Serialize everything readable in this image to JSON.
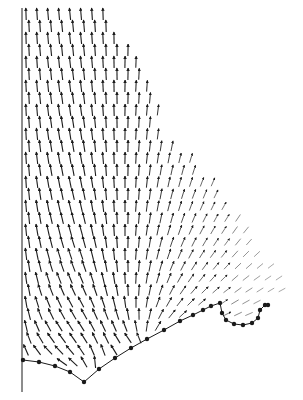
{
  "figure": {
    "type": "vector-field",
    "background": "#ffffff",
    "ink": "#1a1a1a",
    "axis_line": {
      "x": 22,
      "y1": 8,
      "y2": 392
    },
    "boundary_points": [
      [
        23,
        360
      ],
      [
        39,
        362
      ],
      [
        55,
        366
      ],
      [
        70,
        372
      ],
      [
        84,
        382
      ],
      [
        99,
        369
      ],
      [
        115,
        358
      ],
      [
        131,
        348
      ],
      [
        147,
        339
      ],
      [
        164,
        330
      ],
      [
        180,
        321
      ],
      [
        193,
        315
      ],
      [
        203,
        310
      ],
      [
        211,
        306
      ],
      [
        220,
        303
      ],
      [
        222,
        313
      ],
      [
        226,
        320
      ],
      [
        234,
        324
      ],
      [
        243,
        325
      ],
      [
        252,
        323
      ],
      [
        258,
        318
      ],
      [
        260,
        310
      ],
      [
        265,
        305
      ],
      [
        268,
        305
      ]
    ],
    "grid": {
      "x0": 26,
      "dx": 11,
      "y0": 14,
      "dy": 12,
      "cols": 26,
      "rows": 30
    },
    "sources": [
      [
        150,
        345
      ],
      [
        84,
        380
      ]
    ]
  }
}
